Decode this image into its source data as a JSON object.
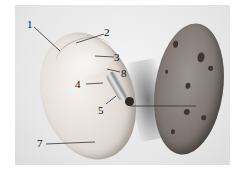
{
  "figure": {
    "labels": [
      {
        "id": "1",
        "text": "1"
      },
      {
        "id": "2",
        "text": "2"
      },
      {
        "id": "3",
        "text": "3"
      },
      {
        "id": "4",
        "text": "4"
      },
      {
        "id": "5",
        "text": "5"
      },
      {
        "id": "7",
        "text": "7"
      },
      {
        "id": "8",
        "text": "8"
      }
    ],
    "colors": {
      "background": "#ffffff",
      "photo_bg": "#e6e6e6",
      "seed_open": "#e3dcd6",
      "seed_closed": "#7f7671",
      "label_text": "#111111"
    }
  }
}
